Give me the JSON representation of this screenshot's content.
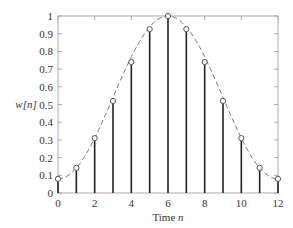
{
  "chart_data": {
    "type": "stem",
    "title": "",
    "xlabel": "Time n",
    "ylabel": "w[n]",
    "xlim": [
      0,
      12
    ],
    "ylim": [
      0,
      1
    ],
    "grid": false,
    "legend": null,
    "x_ticks": [
      0,
      2,
      4,
      6,
      8,
      10,
      12
    ],
    "x_tick_labels": [
      "0",
      "2",
      "4",
      "6",
      "8",
      "10",
      "12"
    ],
    "y_ticks": [
      0,
      0.1,
      0.2,
      0.3,
      0.4,
      0.5,
      0.6,
      0.7,
      0.8,
      0.9,
      1
    ],
    "y_tick_labels": [
      "0",
      "0.1",
      "0.2",
      "0.3",
      "0.4",
      "0.5",
      "0.6",
      "0.7",
      "0.8",
      "0.9",
      "1"
    ],
    "x": [
      0,
      1,
      2,
      3,
      4,
      5,
      6,
      7,
      8,
      9,
      10,
      11,
      12
    ],
    "values": [
      0.08,
      0.142,
      0.31,
      0.52,
      0.74,
      0.926,
      1.0,
      0.926,
      0.74,
      0.52,
      0.31,
      0.142,
      0.08
    ],
    "envelope": "dashed continuous curve through stem tops",
    "colors": {
      "stem": "#222222",
      "marker": "#555555",
      "envelope": "#666666",
      "axis": "#999999"
    }
  },
  "labels": {
    "xlabel_prefix": "Time ",
    "xlabel_var": "n",
    "ylabel": "w[n]"
  }
}
